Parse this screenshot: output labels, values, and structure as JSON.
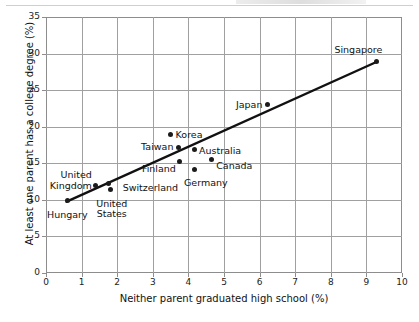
{
  "chart_data": {
    "type": "scatter",
    "title": "",
    "xlabel": "Neither parent graduated high school (%)",
    "ylabel": "At least one parent has a college degree (%)",
    "xlim": [
      0,
      10
    ],
    "ylim": [
      0,
      35
    ],
    "xticks": [
      "0",
      "1",
      "2",
      "3",
      "4",
      "5",
      "6",
      "7",
      "8",
      "9",
      "10"
    ],
    "yticks": [
      "0",
      "5",
      "10",
      "15",
      "20",
      "25",
      "30",
      "35"
    ],
    "grid": true,
    "legend": "none",
    "points": [
      {
        "label": "Hungary",
        "x": 0.6,
        "y": 9.85,
        "label_pos": "below",
        "label_dx": 0,
        "label_dy": 9
      },
      {
        "label": "United\nKingdom",
        "x": 1.4,
        "y": 12.0,
        "label_pos": "left",
        "label_dx": -4,
        "label_dy": -5
      },
      {
        "label": "Switzerland",
        "x": 1.76,
        "y": 12.3,
        "label_pos": "right",
        "label_dx": 14,
        "label_dy": 5
      },
      {
        "label": "United\nStates",
        "x": 1.82,
        "y": 11.4,
        "label_pos": "below",
        "label_dx": 1,
        "label_dy": 9
      },
      {
        "label": "Korea",
        "x": 3.5,
        "y": 18.9,
        "label_pos": "right",
        "label_dx": 5,
        "label_dy": 0
      },
      {
        "label": "Taiwan",
        "x": 3.72,
        "y": 17.2,
        "label_pos": "left",
        "label_dx": -5,
        "label_dy": 0
      },
      {
        "label": "Finland",
        "x": 3.76,
        "y": 15.3,
        "label_pos": "left",
        "label_dx": -4,
        "label_dy": 8
      },
      {
        "label": "Australia",
        "x": 4.16,
        "y": 16.85,
        "label_pos": "right",
        "label_dx": 5,
        "label_dy": 1
      },
      {
        "label": "Germany",
        "x": 4.18,
        "y": 14.2,
        "label_pos": "below",
        "label_dx": 11,
        "label_dy": 9
      },
      {
        "label": "Canada",
        "x": 4.64,
        "y": 15.5,
        "label_pos": "right",
        "label_dx": 5,
        "label_dy": 6
      },
      {
        "label": "Japan",
        "x": 6.22,
        "y": 23.0,
        "label_pos": "left",
        "label_dx": -5,
        "label_dy": 0
      },
      {
        "label": "Singapore",
        "x": 9.28,
        "y": 28.9,
        "label_pos": "above-left",
        "label_dx": 6,
        "label_dy": -12
      }
    ],
    "trendline": {
      "name": "fitted trend line",
      "x0": 0.58,
      "y0": 9.75,
      "x1": 9.28,
      "y1": 28.85
    }
  }
}
